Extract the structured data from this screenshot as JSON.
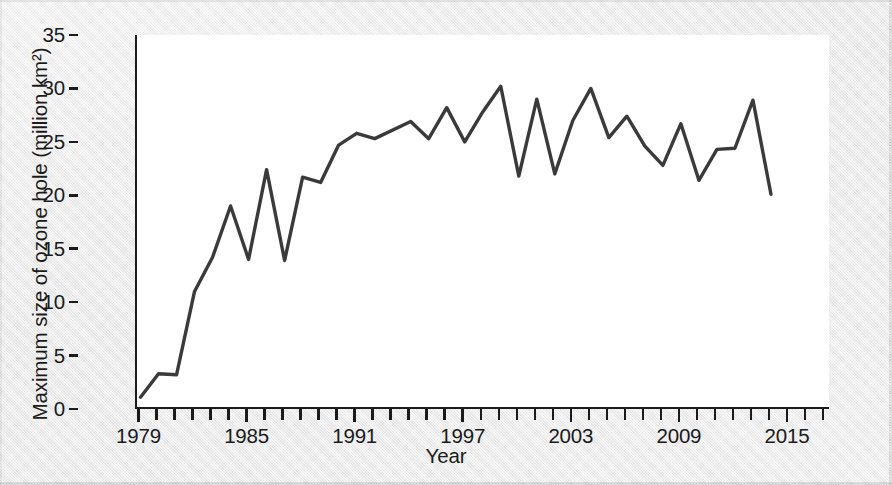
{
  "chart_data": {
    "type": "line",
    "title": "",
    "xlabel": "Year",
    "ylabel": "Maximum size of ozone hole (million km²)",
    "xlim": [
      1979,
      2017
    ],
    "ylim": [
      0,
      35
    ],
    "y_ticks": [
      0,
      5,
      10,
      15,
      20,
      25,
      30,
      35
    ],
    "y_tick_labels": [
      "0",
      "5",
      "10",
      "15",
      "20",
      "25",
      "30",
      "35"
    ],
    "x_ticks": [
      1979,
      1980,
      1981,
      1982,
      1983,
      1984,
      1985,
      1986,
      1987,
      1988,
      1989,
      1990,
      1991,
      1992,
      1993,
      1994,
      1995,
      1996,
      1997,
      1998,
      1999,
      2000,
      2001,
      2002,
      2003,
      2004,
      2005,
      2006,
      2007,
      2008,
      2009,
      2010,
      2011,
      2012,
      2013,
      2014,
      2015,
      2016,
      2017
    ],
    "x_tick_labels": [
      "1979",
      "1985",
      "1991",
      "1997",
      "2003",
      "2009",
      "2015"
    ],
    "x_labeled_ticks": [
      1979,
      1985,
      1991,
      1997,
      2003,
      2009,
      2015
    ],
    "grid": false,
    "legend": null,
    "line_color": "#3a3a3a",
    "line_width": 3.4,
    "series": [
      {
        "name": "Maximum size of ozone hole",
        "gap_years": [
          1995
        ],
        "points": [
          {
            "x": 1979,
            "y": 1.1
          },
          {
            "x": 1980,
            "y": 3.3
          },
          {
            "x": 1981,
            "y": 3.2
          },
          {
            "x": 1982,
            "y": 11.0
          },
          {
            "x": 1983,
            "y": 14.2
          },
          {
            "x": 1984,
            "y": 19.0
          },
          {
            "x": 1985,
            "y": 14.0
          },
          {
            "x": 1986,
            "y": 22.4
          },
          {
            "x": 1987,
            "y": 13.9
          },
          {
            "x": 1988,
            "y": 21.7
          },
          {
            "x": 1989,
            "y": 21.2
          },
          {
            "x": 1990,
            "y": 24.7
          },
          {
            "x": 1991,
            "y": 25.8
          },
          {
            "x": 1992,
            "y": 25.3
          },
          {
            "x": 1994,
            "y": 26.9
          },
          {
            "x": 1995,
            "y": 25.3
          },
          {
            "x": 1996,
            "y": 28.2
          },
          {
            "x": 1997,
            "y": 25.0
          },
          {
            "x": 1998,
            "y": 27.8
          },
          {
            "x": 1999,
            "y": 30.2
          },
          {
            "x": 2000,
            "y": 21.8
          },
          {
            "x": 2001,
            "y": 29.0
          },
          {
            "x": 2002,
            "y": 22.0
          },
          {
            "x": 2003,
            "y": 27.0
          },
          {
            "x": 2004,
            "y": 30.0
          },
          {
            "x": 2005,
            "y": 25.4
          },
          {
            "x": 2006,
            "y": 27.4
          },
          {
            "x": 2007,
            "y": 24.6
          },
          {
            "x": 2008,
            "y": 22.8
          },
          {
            "x": 2009,
            "y": 26.7
          },
          {
            "x": 2010,
            "y": 21.4
          },
          {
            "x": 2011,
            "y": 24.3
          },
          {
            "x": 2012,
            "y": 24.4
          },
          {
            "x": 2013,
            "y": 28.9
          },
          {
            "x": 2014,
            "y": 20.1
          }
        ]
      }
    ]
  },
  "axes": {
    "y_title": "Maximum size of ozone hole (million km²)",
    "x_title": "Year"
  }
}
